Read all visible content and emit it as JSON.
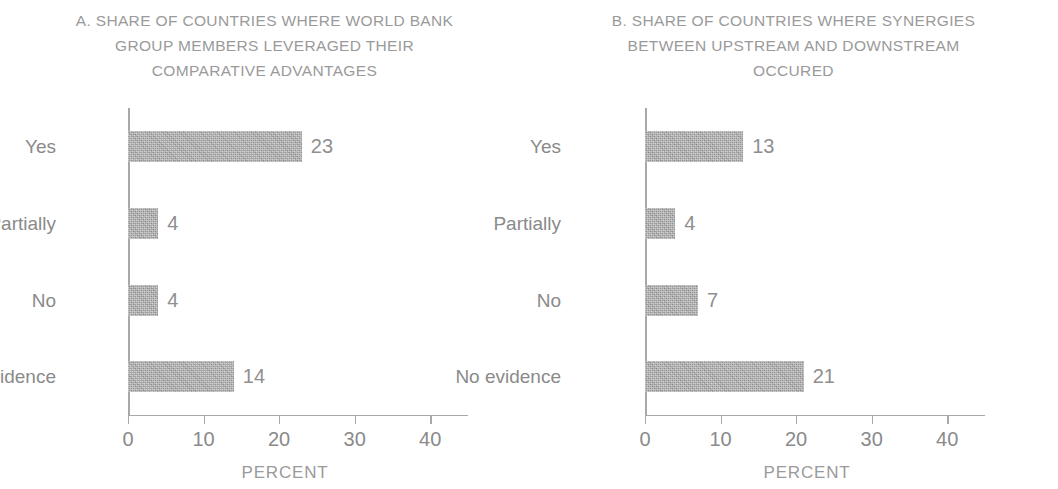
{
  "figure": {
    "bar_color": "#a9a9a9",
    "axis_color": "#a8a8a8",
    "text_color": "#8a8a8a"
  },
  "chart_data": [
    {
      "type": "bar",
      "orientation": "horizontal",
      "panel_label": "A.",
      "title": "A. SHARE OF COUNTRIES WHERE WORLD BANK\nGROUP MEMBERS LEVERAGED THEIR\nCOMPARATIVE ADVANTAGES",
      "categories": [
        "Yes",
        "Partially",
        "No",
        "No evidence"
      ],
      "values": [
        23,
        4,
        4,
        14
      ],
      "data_labels": [
        "23",
        "4",
        "4",
        "14"
      ],
      "xlabel": "PERCENT",
      "ylabel": "",
      "xlim": [
        0,
        45
      ],
      "xticks": [
        0,
        10,
        20,
        30,
        40
      ],
      "xtick_labels": [
        "0",
        "10",
        "20",
        "30",
        "40"
      ],
      "grid": false,
      "legend": false
    },
    {
      "type": "bar",
      "orientation": "horizontal",
      "panel_label": "B.",
      "title": "B. SHARE OF COUNTRIES WHERE SYNERGIES\nBETWEEN UPSTREAM AND DOWNSTREAM\nOCCURED",
      "categories": [
        "Yes",
        "Partially",
        "No",
        "No evidence"
      ],
      "values": [
        13,
        4,
        7,
        21
      ],
      "data_labels": [
        "13",
        "4",
        "7",
        "21"
      ],
      "xlabel": "PERCENT",
      "ylabel": "",
      "xlim": [
        0,
        45
      ],
      "xticks": [
        0,
        10,
        20,
        30,
        40
      ],
      "xtick_labels": [
        "0",
        "10",
        "20",
        "30",
        "40"
      ],
      "grid": false,
      "legend": false
    }
  ]
}
